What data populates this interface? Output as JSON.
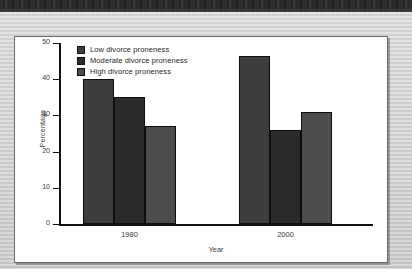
{
  "figure": {
    "panel_background": "#ffffff",
    "page_background": "#cccccc"
  },
  "chart_data": {
    "type": "bar",
    "title": "",
    "xlabel": "Year",
    "ylabel": "Percentage",
    "categories": [
      "1980",
      "2000"
    ],
    "series": [
      {
        "name": "Low divorce proneness",
        "values": [
          40,
          46.5
        ],
        "color": "#3d3d3d"
      },
      {
        "name": "Moderate divorce proneness",
        "values": [
          35,
          26
        ],
        "color": "#2b2b2b"
      },
      {
        "name": "High divorce proneness",
        "values": [
          27,
          31
        ],
        "color": "#4d4d4d"
      }
    ],
    "ylim": [
      0,
      50
    ],
    "yticks": [
      0,
      10,
      20,
      30,
      40,
      50
    ],
    "ytick_labels": [
      "0",
      "10",
      "20",
      "30",
      "40",
      "50"
    ],
    "grid": false,
    "legend_position": "top-left",
    "axis_color": "#111111"
  }
}
